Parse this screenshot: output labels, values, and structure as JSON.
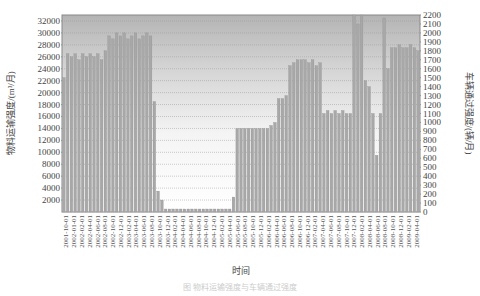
{
  "chart_data": {
    "type": "bar",
    "title": "",
    "xlabel": "时间",
    "ylabel": "物料运输强度/(m³/月)",
    "ylabel_right": "车辆通过强度/(辆/月)",
    "ylim": [
      0,
      33000
    ],
    "ylim_right": [
      0,
      2200
    ],
    "yticks": [
      2000,
      4000,
      6000,
      8000,
      10000,
      12000,
      14000,
      16000,
      18000,
      20000,
      22000,
      24000,
      26000,
      28000,
      30000,
      32000
    ],
    "yticks_right": [
      0,
      100,
      200,
      300,
      400,
      500,
      600,
      700,
      800,
      900,
      1000,
      1100,
      1200,
      1300,
      1400,
      1500,
      1600,
      1700,
      1800,
      1900,
      2000,
      2100,
      2200
    ],
    "grid": true,
    "legend": null,
    "xtick_labels": [
      "2001-10-01",
      "2002-01-01",
      "2002-02-01",
      "2002-04-01",
      "2002-06-01",
      "2002-08-01",
      "2002-10-01",
      "2002-12-01",
      "2003-02-01",
      "2003-04-01",
      "2003-06-01",
      "2003-08-01",
      "2003-10-01",
      "2003-12-01",
      "2004-02-01",
      "2004-04-01",
      "2004-06-01",
      "2004-08-01",
      "2004-10-01",
      "2004-12-01",
      "2005-02-01",
      "2005-04-01",
      "2005-06-01",
      "2005-08-01",
      "2005-10-01",
      "2005-12-01",
      "2006-02-01",
      "2006-04-01",
      "2006-06-01",
      "2006-08-01",
      "2006-10-01",
      "2006-12-01",
      "2007-02-01",
      "2007-04-01",
      "2007-06-01",
      "2007-08-01",
      "2007-10-01",
      "2007-12-01",
      "2008-02-01",
      "2008-04-01",
      "2008-06-01",
      "2008-08-01",
      "2008-10-01",
      "2008-12-01",
      "2009-02-01",
      "2009-04-01"
    ],
    "series": [
      {
        "name": "物料运输强度",
        "values": [
          22500,
          26500,
          26000,
          26500,
          25500,
          26500,
          26000,
          26500,
          26000,
          26500,
          25500,
          27000,
          29500,
          29000,
          30000,
          29500,
          30000,
          29000,
          29500,
          30000,
          29000,
          29500,
          30000,
          29500,
          18500,
          3500,
          2000,
          500,
          500,
          500,
          500,
          500,
          500,
          500,
          500,
          500,
          500,
          500,
          500,
          500,
          500,
          500,
          500,
          500,
          500,
          2500,
          14000,
          14000,
          14000,
          14000,
          14000,
          14000,
          14000,
          14000,
          14000,
          14500,
          15000,
          19000,
          19000,
          19500,
          24500,
          25000,
          25500,
          25500,
          25500,
          25000,
          25500,
          24500,
          25000,
          16500,
          17000,
          16500,
          17000,
          16500,
          17000,
          16500,
          16500,
          33000,
          31500,
          33000,
          22000,
          21000,
          16500,
          9500,
          16500,
          32500,
          24000,
          27500,
          27500,
          28000,
          27500,
          27500,
          28000,
          27500,
          27000
        ]
      }
    ]
  },
  "axis": {
    "left_title": "物料运输强度/(m³/月)",
    "right_title": "车辆通过强度/(辆/月)",
    "x_title": "时间"
  },
  "caption": "图  物料运输强度与车辆通过强度"
}
